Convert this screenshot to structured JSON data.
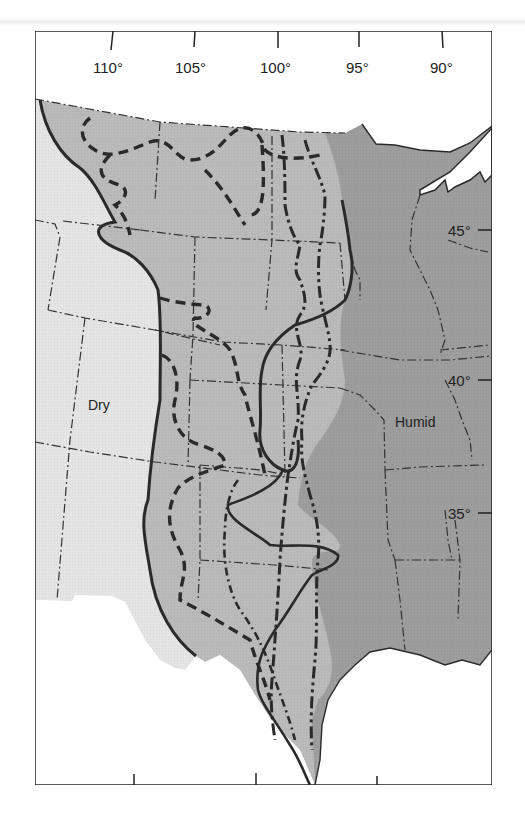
{
  "figure": {
    "type": "climate-boundary map",
    "regions": [
      {
        "id": "dry",
        "label": "Dry",
        "color": "#e3e3e3"
      },
      {
        "id": "transition",
        "label": "",
        "color": "#b9b9b9"
      },
      {
        "id": "humid",
        "label": "Humid",
        "color": "#9d9d9d"
      }
    ],
    "longitude_ticks": [
      {
        "label": "110°",
        "x": 113
      },
      {
        "label": "105°",
        "x": 195
      },
      {
        "label": "100°",
        "x": 278
      },
      {
        "label": "95°",
        "x": 359
      },
      {
        "label": "90°",
        "x": 442
      }
    ],
    "latitude_ticks": [
      {
        "label": "45°",
        "y": 230
      },
      {
        "label": "40°",
        "y": 380
      },
      {
        "label": "35°",
        "y": 512
      }
    ],
    "colors": {
      "frame": "#222222",
      "boundary_line": "#2a2a2a",
      "water": "#ffffff"
    }
  }
}
